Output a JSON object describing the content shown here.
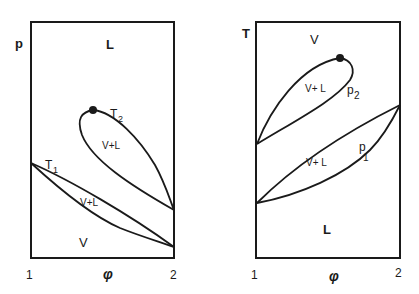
{
  "diagrams": {
    "left": {
      "y_axis_label": "p",
      "x_axis_label": "φ",
      "x_ticks": [
        "1",
        "2"
      ],
      "regions": {
        "top": "L",
        "bottom": "V",
        "lens_lower": "V+L",
        "loop_upper": "V+L"
      },
      "curve_labels": {
        "lower": "T",
        "lower_sub": "1",
        "upper": "T",
        "upper_sub": "2"
      }
    },
    "right": {
      "y_axis_label": "T",
      "x_axis_label": "φ",
      "x_ticks": [
        "1",
        "2"
      ],
      "regions": {
        "top": "V",
        "bottom": "L",
        "lens_lower": "V+ L",
        "loop_upper": "V+ L"
      },
      "curve_labels": {
        "lower": "p",
        "lower_sub": "1",
        "upper": "p",
        "upper_sub": "2"
      }
    }
  },
  "colors": {
    "ink": "#1a1a1a",
    "background": "#ffffff"
  }
}
